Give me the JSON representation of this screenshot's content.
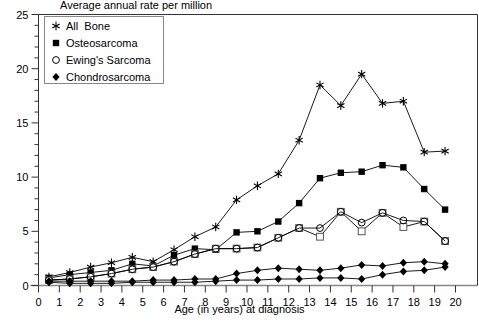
{
  "chart_data": {
    "type": "line",
    "title": "Average annual rate per million",
    "xlabel": "Age (in years) at diagnosis",
    "ylabel": "",
    "xlim": [
      0,
      20
    ],
    "ylim": [
      0,
      25
    ],
    "xticks": [
      "0",
      "1",
      "2",
      "3",
      "4",
      "5",
      "6",
      "7",
      "8",
      "9",
      "10",
      "11",
      "12",
      "13",
      "14",
      "15",
      "16",
      "17",
      "18",
      "19",
      "20"
    ],
    "yticks": [
      "0",
      "5",
      "10",
      "15",
      "20",
      "25"
    ],
    "xtick_step": 1,
    "ytick_step": 5,
    "yminor_step": 1,
    "grid": false,
    "legend_position": "top-left-inside",
    "x": [
      0.5,
      1.5,
      2.5,
      3.5,
      4.5,
      5.5,
      6.5,
      7.5,
      8.5,
      9.5,
      10.5,
      11.5,
      12.5,
      13.5,
      14.5,
      15.5,
      16.5,
      17.5,
      18.5,
      19.5
    ],
    "series": [
      {
        "name": "All  Bone",
        "marker": "star",
        "values": [
          0.8,
          1.2,
          1.7,
          2.1,
          2.6,
          2.2,
          3.3,
          4.5,
          5.4,
          7.9,
          9.2,
          10.3,
          13.4,
          18.5,
          16.6,
          19.5,
          16.8,
          17.0,
          12.3,
          12.4
        ]
      },
      {
        "name": "Osteosarcoma",
        "marker": "filled-square",
        "values": [
          0.7,
          1.0,
          1.2,
          1.4,
          2.0,
          1.8,
          2.8,
          3.4,
          3.3,
          4.9,
          5.0,
          5.9,
          7.6,
          9.9,
          10.4,
          10.5,
          11.1,
          10.9,
          8.9,
          7.0
        ]
      },
      {
        "name": "Ewing's Sarcoma",
        "marker": "open-square",
        "values": [
          0.5,
          0.6,
          0.8,
          1.1,
          1.5,
          1.7,
          2.2,
          2.9,
          3.4,
          3.4,
          3.5,
          4.4,
          5.3,
          4.5,
          6.8,
          5.0,
          6.7,
          5.4,
          5.9,
          4.1
        ]
      },
      {
        "name": "Chondrosarcoma",
        "marker": "filled-diamond",
        "values": [
          0.3,
          0.2,
          0.2,
          0.2,
          0.3,
          0.3,
          0.3,
          0.3,
          0.4,
          0.5,
          0.5,
          0.6,
          0.6,
          0.7,
          0.7,
          0.6,
          1.0,
          1.3,
          1.4,
          1.7
        ]
      },
      {
        "name": "Ewing's Sarcoma open-circle overlay",
        "marker": "open-circle",
        "values": [
          0.5,
          0.6,
          0.8,
          1.1,
          1.5,
          1.7,
          2.2,
          2.9,
          3.4,
          3.4,
          3.5,
          4.4,
          5.3,
          5.3,
          6.8,
          5.8,
          6.7,
          6.0,
          5.9,
          4.1
        ]
      },
      {
        "name": "Chondrosarcoma upper",
        "marker": "filled-diamond",
        "values": [
          0.4,
          0.4,
          0.4,
          0.4,
          0.4,
          0.5,
          0.5,
          0.6,
          0.6,
          1.1,
          1.4,
          1.6,
          1.5,
          1.4,
          1.6,
          1.9,
          1.8,
          2.1,
          2.2,
          2.0
        ]
      }
    ]
  },
  "legend": {
    "items": [
      {
        "label": "All  Bone",
        "marker": "star"
      },
      {
        "label": "Osteosarcoma",
        "marker": "filled-square"
      },
      {
        "label": "Ewing's Sarcoma",
        "marker": "open-circle"
      },
      {
        "label": "Chondrosarcoma",
        "marker": "filled-diamond"
      }
    ]
  }
}
